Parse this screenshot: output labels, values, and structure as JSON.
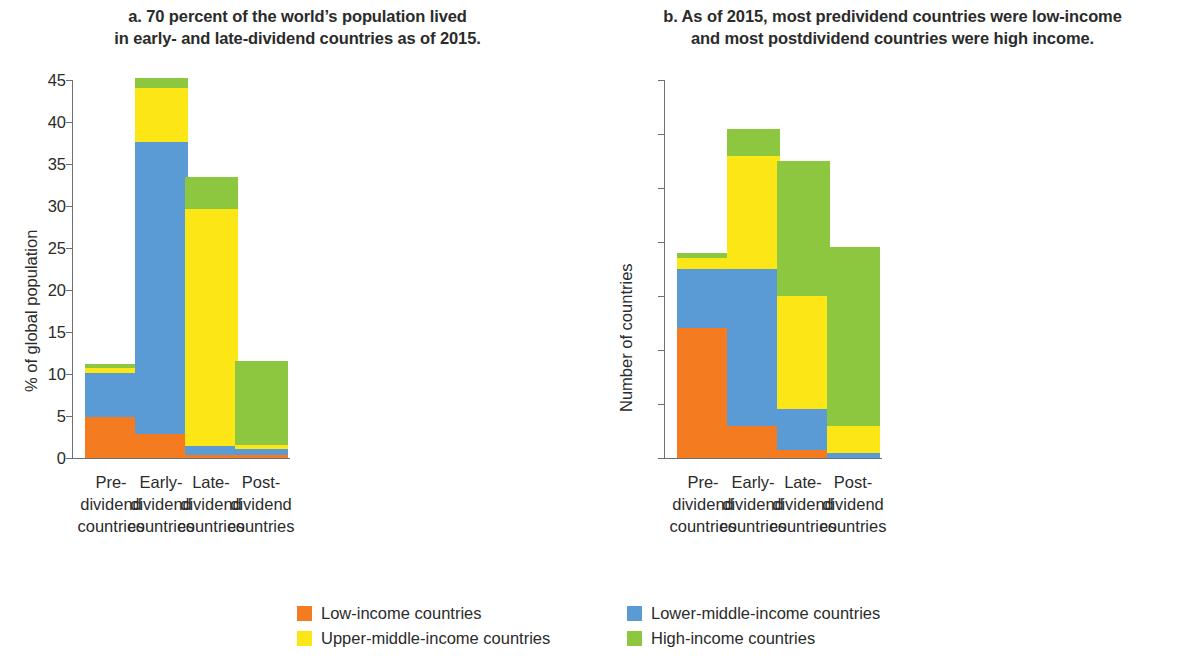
{
  "chart_data": [
    {
      "type": "bar",
      "panel": "a",
      "title": "a. 70 percent of the world’s population lived in early- and late-dividend countries as of 2015.",
      "title_lines": [
        "a. 70 percent of the world’s population lived",
        "in early- and late-dividend countries as of 2015."
      ],
      "stacked": true,
      "xlabel": "",
      "ylabel": "% of global population",
      "ylim": [
        0,
        45
      ],
      "ytick_step": 5,
      "yticks": [
        0,
        5,
        10,
        15,
        20,
        25,
        30,
        35,
        40,
        45
      ],
      "ytick_labels": [
        "0",
        "5",
        "10",
        "15",
        "20",
        "25",
        "30",
        "35",
        "40",
        "45"
      ],
      "grid": false,
      "legend_position": "bottom",
      "categories": [
        "Pre-dividend countries",
        "Early-dividend countries",
        "Late-dividend countries",
        "Post-dividend countries"
      ],
      "category_lines": [
        [
          "Pre-",
          "dividend",
          "countries"
        ],
        [
          "Early-",
          "dividend",
          "countries"
        ],
        [
          "Late-",
          "dividend",
          "countries"
        ],
        [
          "Post-",
          "dividend",
          "countries"
        ]
      ],
      "series": [
        {
          "name": "Low-income countries",
          "color": "#F47B20",
          "values": [
            4.9,
            2.9,
            0.3,
            0.3
          ]
        },
        {
          "name": "Lower-middle-income countries",
          "color": "#5B9BD5",
          "values": [
            5.2,
            34.7,
            1.1,
            0.8
          ]
        },
        {
          "name": "Upper-middle-income countries",
          "color": "#FCE616",
          "values": [
            0.6,
            6.4,
            28.2,
            0.5
          ]
        },
        {
          "name": "High-income countries",
          "color": "#8DC63F",
          "values": [
            0.5,
            1.3,
            3.9,
            9.9
          ]
        }
      ],
      "totals": [
        11.2,
        45.3,
        33.5,
        11.5
      ]
    },
    {
      "type": "bar",
      "panel": "b",
      "title": "b. As of 2015, most predividend countries were low-income and most postdividend countries were high income.",
      "title_lines": [
        "b. As of 2015, most predividend countries were low-income",
        "and most postdividend countries were high income."
      ],
      "stacked": true,
      "xlabel": "",
      "ylabel": "Number of countries",
      "ylim": [
        0,
        70
      ],
      "ytick_step": 10,
      "yticks": [
        0,
        10,
        20,
        30,
        40,
        50,
        60,
        70
      ],
      "ytick_labels": [
        "0",
        "10",
        "20",
        "30",
        "40",
        "50",
        "60",
        "70"
      ],
      "grid": false,
      "legend_position": "bottom",
      "categories": [
        "Pre-dividend countries",
        "Early-dividend countries",
        "Late-dividend countries",
        "Post-dividend countries"
      ],
      "category_lines": [
        [
          "Pre-",
          "dividend",
          "countries"
        ],
        [
          "Early-",
          "dividend",
          "countries"
        ],
        [
          "Late-",
          "dividend",
          "countries"
        ],
        [
          "Post-",
          "dividend",
          "countries"
        ]
      ],
      "series": [
        {
          "name": "Low-income countries",
          "color": "#F47B20",
          "values": [
            24,
            6,
            1.5,
            0
          ]
        },
        {
          "name": "Lower-middle-income countries",
          "color": "#5B9BD5",
          "values": [
            11,
            29,
            7.5,
            1
          ]
        },
        {
          "name": "Upper-middle-income countries",
          "color": "#FCE616",
          "values": [
            2,
            21,
            21,
            5
          ]
        },
        {
          "name": "High-income countries",
          "color": "#8DC63F",
          "values": [
            1,
            5,
            25,
            33
          ]
        }
      ],
      "totals": [
        38,
        61,
        55,
        39
      ]
    }
  ],
  "legend": {
    "items": [
      {
        "label": "Low-income countries",
        "color": "#F47B20"
      },
      {
        "label": "Lower-middle-income countries",
        "color": "#5B9BD5"
      },
      {
        "label": "Upper-middle-income countries",
        "color": "#FCE616"
      },
      {
        "label": "High-income countries",
        "color": "#8DC63F"
      }
    ]
  },
  "colors": {
    "low_income": "#F47B20",
    "lower_middle_income": "#5B9BD5",
    "upper_middle_income": "#FCE616",
    "high_income": "#8DC63F",
    "axis": "#6d6e71",
    "text": "#2b2b2b"
  }
}
